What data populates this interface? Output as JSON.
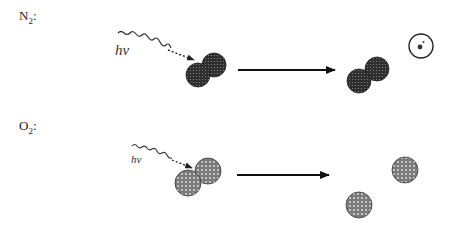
{
  "rows": [
    {
      "molecule": {
        "symbol": "N",
        "subscript": "2",
        "suffix": ":"
      },
      "photon_label": "hν",
      "reactant": "N2 molecule (two bonded atoms)",
      "product": "N2+ ion with ejected electron",
      "electron_label": "e-"
    },
    {
      "molecule": {
        "symbol": "O",
        "subscript": "2",
        "suffix": ":"
      },
      "photon_label": "hν",
      "reactant": "O2 molecule (two bonded atoms)",
      "product": "two separate O atoms"
    }
  ],
  "colors": {
    "n_atom": "#3a3a3a",
    "o_atom": "#8a8a8a",
    "line": "#111111"
  }
}
